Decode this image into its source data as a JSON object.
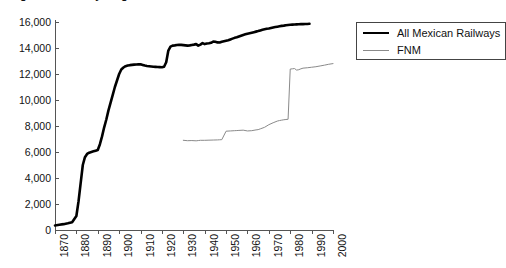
{
  "figure": {
    "title_clipped": "Figure 1. Railway length",
    "background": "#ffffff"
  },
  "legend": {
    "position": "top-right",
    "entries": [
      {
        "label": "All Mexican Railways",
        "color": "#000000",
        "style": "thick-line"
      },
      {
        "label": "FNM",
        "color": "#8a8a8a",
        "style": "thin-line"
      }
    ]
  },
  "chart_data": {
    "type": "line",
    "title": "Figure 1. Railway length",
    "xlabel": "",
    "ylabel": "",
    "xlim": [
      1870,
      2000
    ],
    "ylim": [
      0,
      16000
    ],
    "grid": false,
    "legend_position": "top-right",
    "xticks": [
      "1870",
      "1880",
      "1890",
      "1900",
      "1910",
      "1920",
      "1930",
      "1940",
      "1950",
      "1960",
      "1970",
      "1980",
      "1990",
      "2000"
    ],
    "yticks": [
      "0",
      "2,000",
      "4,000",
      "6,000",
      "8,000",
      "10,000",
      "12,000",
      "14,000",
      "16,000"
    ],
    "series": [
      {
        "name": "All Mexican Railways",
        "color": "#000000",
        "x": [
          1870,
          1872,
          1874,
          1876,
          1878,
          1880,
          1881,
          1882,
          1883,
          1884,
          1885,
          1886,
          1887,
          1888,
          1889,
          1890,
          1891,
          1892,
          1893,
          1894,
          1895,
          1896,
          1897,
          1898,
          1899,
          1900,
          1901,
          1902,
          1903,
          1904,
          1905,
          1906,
          1907,
          1908,
          1909,
          1910,
          1911,
          1912,
          1913,
          1914,
          1915,
          1916,
          1917,
          1918,
          1919,
          1920,
          1921,
          1922,
          1923,
          1924,
          1925,
          1926,
          1927,
          1928,
          1929,
          1930,
          1931,
          1932,
          1933,
          1934,
          1935,
          1936,
          1937,
          1938,
          1939,
          1940,
          1941,
          1942,
          1943,
          1944,
          1945,
          1946,
          1947,
          1948,
          1949,
          1950,
          1951,
          1952,
          1953,
          1954,
          1955,
          1956,
          1957,
          1958,
          1959,
          1960,
          1961,
          1962,
          1963,
          1964,
          1965,
          1966,
          1967,
          1968,
          1969,
          1970,
          1971,
          1972,
          1973,
          1974,
          1975,
          1976,
          1977,
          1978,
          1979,
          1980,
          1981,
          1982,
          1983,
          1984,
          1985,
          1986,
          1987,
          1988,
          1989
        ],
        "values": [
          350,
          400,
          450,
          520,
          600,
          1080,
          2200,
          3600,
          5000,
          5600,
          5850,
          5950,
          6000,
          6050,
          6100,
          6150,
          6600,
          7200,
          7900,
          8500,
          9200,
          9800,
          10400,
          11000,
          11500,
          12000,
          12350,
          12500,
          12600,
          12650,
          12680,
          12700,
          12720,
          12730,
          12740,
          12750,
          12700,
          12650,
          12620,
          12600,
          12580,
          12560,
          12550,
          12540,
          12530,
          12520,
          12560,
          12900,
          13800,
          14100,
          14180,
          14200,
          14230,
          14250,
          14240,
          14220,
          14200,
          14180,
          14200,
          14230,
          14260,
          14300,
          14180,
          14260,
          14380,
          14300,
          14340,
          14360,
          14400,
          14500,
          14480,
          14430,
          14420,
          14480,
          14520,
          14560,
          14600,
          14660,
          14720,
          14780,
          14820,
          14880,
          14940,
          15000,
          15050,
          15100,
          15140,
          15180,
          15220,
          15260,
          15300,
          15350,
          15400,
          15440,
          15480,
          15500,
          15540,
          15580,
          15610,
          15640,
          15670,
          15700,
          15720,
          15750,
          15770,
          15790,
          15800,
          15810,
          15820,
          15830,
          15840,
          15840,
          15850,
          15850,
          15860
        ]
      },
      {
        "name": "FNM",
        "color": "#8a8a8a",
        "x": [
          1930,
          1932,
          1934,
          1936,
          1937,
          1938,
          1940,
          1942,
          1944,
          1946,
          1947,
          1948,
          1950,
          1952,
          1954,
          1955,
          1956,
          1958,
          1960,
          1962,
          1964,
          1965,
          1966,
          1968,
          1970,
          1972,
          1974,
          1975,
          1976,
          1977,
          1978,
          1979,
          1980,
          1981,
          1982,
          1983,
          1984,
          1985,
          1986,
          1988,
          1990,
          1992,
          1994,
          1996,
          1998,
          2000
        ],
        "values": [
          6900,
          6870,
          6880,
          6860,
          6880,
          6900,
          6900,
          6910,
          6920,
          6930,
          6940,
          6950,
          7600,
          7620,
          7640,
          7650,
          7660,
          7680,
          7620,
          7640,
          7700,
          7720,
          7780,
          7900,
          8100,
          8250,
          8380,
          8420,
          8450,
          8480,
          8500,
          8520,
          12380,
          12400,
          12420,
          12300,
          12330,
          12400,
          12450,
          12480,
          12520,
          12560,
          12620,
          12680,
          12750,
          12800
        ]
      }
    ]
  }
}
